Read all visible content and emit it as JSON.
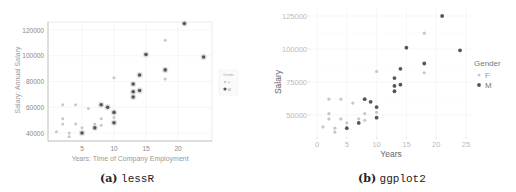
{
  "chart_data": [
    {
      "type": "scatter",
      "panel": "a",
      "caption_label": "(a)",
      "caption_name": "lessR",
      "title": "",
      "xlabel": "Years: Time of Company Employment",
      "ylabel": "Salary: Annual Salary",
      "xticks": [
        5,
        10,
        15,
        20
      ],
      "yticks": [
        40000,
        60000,
        80000,
        100000,
        120000
      ],
      "xlim": [
        0.5,
        25
      ],
      "ylim": [
        34000,
        126000
      ],
      "grid": true,
      "legend": {
        "title": "Gender",
        "position": "right",
        "entries": [
          "F",
          "M"
        ]
      },
      "colors": {
        "F": "#c8c8c8",
        "M": "#555555"
      }
    },
    {
      "type": "scatter",
      "panel": "b",
      "caption_label": "(b)",
      "caption_name": "ggplot2",
      "title": "",
      "xlabel": "Years",
      "ylabel": "Salary",
      "xticks": [
        0,
        5,
        10,
        15,
        20,
        25
      ],
      "yticks": [
        50000,
        75000,
        100000,
        125000
      ],
      "xlim": [
        -1,
        26
      ],
      "ylim": [
        34000,
        128000
      ],
      "grid": true,
      "legend": {
        "title": "Gender",
        "position": "right",
        "entries": [
          "F",
          "M"
        ]
      },
      "colors": {
        "F": "#c8c8c8",
        "M": "#555555"
      }
    }
  ],
  "series": [
    {
      "name": "M",
      "points": [
        [
          21,
          125000
        ],
        [
          15,
          101000
        ],
        [
          24,
          99000
        ],
        [
          18,
          89000
        ],
        [
          14,
          85000
        ],
        [
          13,
          78000
        ],
        [
          14,
          73000
        ],
        [
          13,
          72000
        ],
        [
          13,
          68000
        ],
        [
          8,
          62000
        ],
        [
          9,
          60000
        ],
        [
          10,
          56000
        ],
        [
          10,
          48000
        ],
        [
          7,
          44000
        ],
        [
          5,
          40000
        ]
      ]
    },
    {
      "name": "F",
      "points": [
        [
          18,
          112000
        ],
        [
          10,
          83000
        ],
        [
          18,
          82000
        ],
        [
          2,
          62000
        ],
        [
          4,
          62000
        ],
        [
          6,
          59000
        ],
        [
          2,
          51000
        ],
        [
          8,
          51000
        ],
        [
          10,
          52000
        ],
        [
          2,
          47000
        ],
        [
          4,
          47000
        ],
        [
          7,
          47000
        ],
        [
          8,
          46000
        ],
        [
          5,
          44000
        ],
        [
          1,
          41000
        ],
        [
          3,
          40000
        ],
        [
          3,
          37000
        ]
      ]
    }
  ]
}
